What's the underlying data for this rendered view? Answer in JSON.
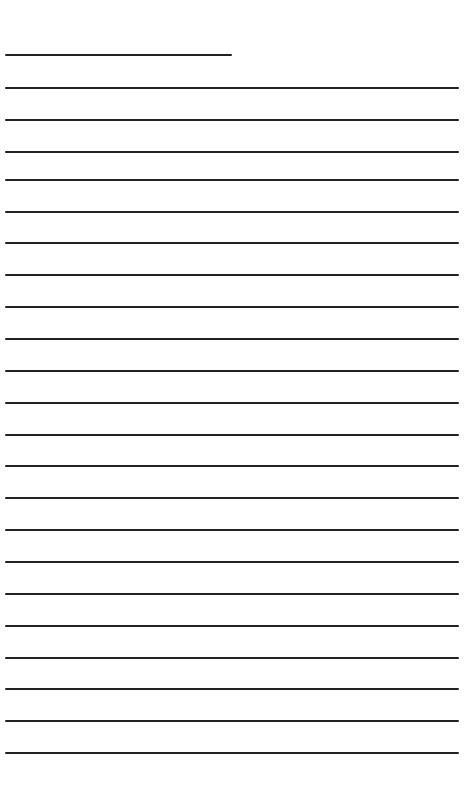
{
  "page": {
    "type": "lined-paper",
    "background": "#ffffff",
    "line_color": "#222222",
    "line_thickness_px": 2
  },
  "header_line": {
    "x": 5,
    "y": 54,
    "width": 227
  },
  "ruled_lines": {
    "x": 5,
    "width": 454,
    "y_positions": [
      87,
      119,
      151,
      179,
      211,
      242,
      274,
      306,
      338,
      370,
      402,
      434,
      465,
      497,
      529,
      561,
      593,
      625,
      657,
      688,
      720,
      752
    ]
  }
}
